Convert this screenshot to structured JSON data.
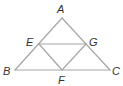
{
  "diagram": {
    "type": "geometry",
    "points": {
      "A": {
        "label": "A",
        "x": 62,
        "y": 18,
        "lx": 57,
        "ly": 13
      },
      "B": {
        "label": "B",
        "x": 15,
        "y": 70,
        "lx": 3,
        "ly": 75
      },
      "C": {
        "label": "C",
        "x": 110,
        "y": 70,
        "lx": 112,
        "ly": 75
      },
      "E": {
        "label": "E",
        "x": 39,
        "y": 44,
        "lx": 26,
        "ly": 46
      },
      "G": {
        "label": "G",
        "x": 86,
        "y": 44,
        "lx": 89,
        "ly": 46
      },
      "F": {
        "label": "F",
        "x": 62,
        "y": 70,
        "lx": 58,
        "ly": 84
      }
    },
    "segments": [
      [
        "A",
        "B"
      ],
      [
        "A",
        "C"
      ],
      [
        "B",
        "C"
      ],
      [
        "E",
        "G"
      ],
      [
        "E",
        "F"
      ],
      [
        "G",
        "F"
      ]
    ],
    "line_color": "#a6a6a6",
    "label_color": "#333333"
  }
}
